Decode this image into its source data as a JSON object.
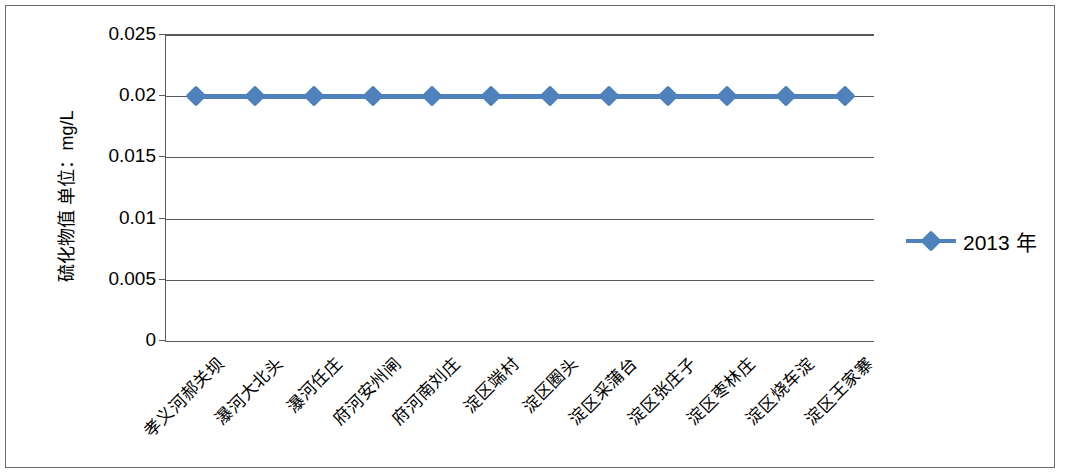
{
  "chart_data": {
    "type": "line",
    "title": "",
    "xlabel": "",
    "ylabel": "硫化物值 单位：mg/L",
    "ylim": [
      0,
      0.025
    ],
    "ytick_labels": [
      "0",
      "0.005",
      "0.01",
      "0.015",
      "0.02",
      "0.025"
    ],
    "ytick_values": [
      0,
      0.005,
      0.01,
      0.015,
      0.02,
      0.025
    ],
    "grid": true,
    "legend_position": "right",
    "categories": [
      "孝义河郝关坝",
      "瀑河大北头",
      "瀑河任庄",
      "府河安州闸",
      "府河南刘庄",
      "淀区端村",
      "淀区圈头",
      "淀区采蒲台",
      "淀区张庄子",
      "淀区枣林庄",
      "淀区烧车淀",
      "淀区王家寨"
    ],
    "series": [
      {
        "name": "2013 年",
        "color": "#4f81bd",
        "marker": "diamond",
        "values": [
          0.02,
          0.02,
          0.02,
          0.02,
          0.02,
          0.02,
          0.02,
          0.02,
          0.02,
          0.02,
          0.02,
          0.02
        ]
      }
    ]
  },
  "legend": {
    "entries": [
      {
        "label": "2013 年",
        "color": "#4f81bd",
        "marker": "diamond"
      }
    ]
  },
  "colors": {
    "series_blue": "#4f81bd",
    "axis_gray": "#5a5a5a",
    "frame_gray": "#6b6b6b",
    "background": "#ffffff"
  }
}
